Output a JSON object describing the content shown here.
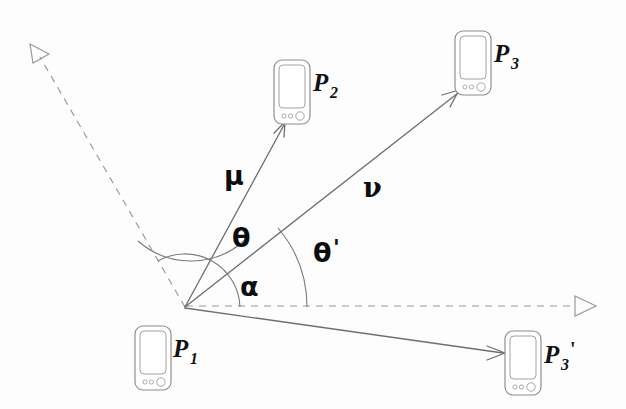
{
  "diagram": {
    "background_color": "#fdfdfd",
    "line_color": "#6e6e6e",
    "dashed_color": "#9a9a9a",
    "label_color": "#111111",
    "width": 626,
    "height": 409
  },
  "nodes": [
    {
      "id": "p1",
      "label": "P",
      "subscript": "1",
      "prime": "",
      "icon": "smartphone-icon",
      "x": 152,
      "y": 357
    },
    {
      "id": "p2",
      "label": "P",
      "subscript": "2",
      "prime": "",
      "icon": "smartphone-icon",
      "x": 290,
      "y": 91
    },
    {
      "id": "p3",
      "label": "P",
      "subscript": "3",
      "prime": "",
      "icon": "smartphone-icon",
      "x": 472,
      "y": 62
    },
    {
      "id": "p3prime",
      "label": "P",
      "subscript": "3",
      "prime": "'",
      "icon": "smartphone-icon",
      "x": 522,
      "y": 363
    }
  ],
  "vertex": {
    "name": "origin-vertex",
    "x": 185,
    "y": 307
  },
  "vectors": [
    {
      "id": "mu",
      "label": "μ",
      "from": "vertex",
      "to": "p2",
      "label_x": 224,
      "label_y": 185,
      "tip_x": 283,
      "tip_y": 124
    },
    {
      "id": "nu",
      "label": "ν",
      "from": "vertex",
      "to": "p3",
      "label_x": 363,
      "label_y": 197,
      "tip_x": 457,
      "tip_y": 92
    },
    {
      "id": "p3prime-vector",
      "label": "",
      "from": "vertex",
      "to": "p3prime",
      "label_x": 0,
      "label_y": 0,
      "tip_x": 501,
      "tip_y": 352
    }
  ],
  "angles": [
    {
      "id": "theta",
      "label": "θ",
      "between": "mu-and-nu",
      "radius": 80,
      "label_x": 232,
      "label_y": 247
    },
    {
      "id": "theta-prime",
      "label": "θ",
      "prime": "'",
      "between": "baseline-and-nu",
      "radius": 122,
      "label_x": 313,
      "label_y": 262
    },
    {
      "id": "alpha",
      "label": "α",
      "between": "baseline-and-mu",
      "radius": 55,
      "label_x": 240,
      "label_y": 296
    }
  ],
  "reference_rays": [
    {
      "id": "dashed-upper-left",
      "style": "dashed",
      "arrowhead": "open-triangle",
      "tip_x": 33,
      "tip_y": 48,
      "from": "vertex"
    },
    {
      "id": "dashed-right-baseline",
      "style": "dashed",
      "arrowhead": "open-triangle",
      "tip_x": 592,
      "tip_y": 306,
      "from": "vertex"
    }
  ],
  "legend_note": ""
}
